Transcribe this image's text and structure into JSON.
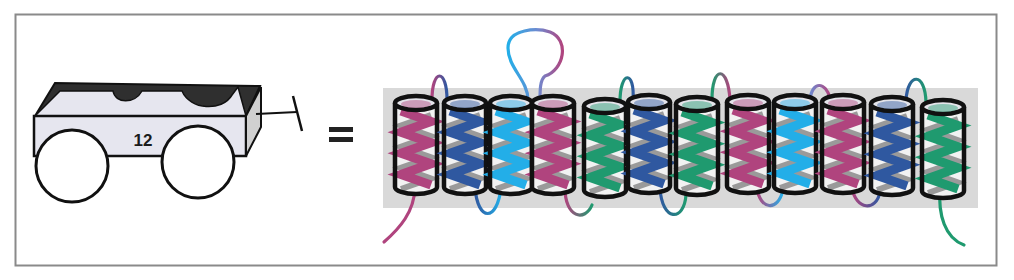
{
  "figure": {
    "cart": {
      "label": "12",
      "body_fill": "#e6e6ef",
      "top_fill": "#2f2f2f",
      "side_fill": "#d0d0d0"
    },
    "equals_sign": "=",
    "membrane": {
      "fill": "#d9d9d9",
      "x": 383,
      "y": 88,
      "width": 595,
      "height": 120
    },
    "colors": {
      "magenta": "#b0447e",
      "blue": "#2f58a0",
      "cyan": "#23aee8",
      "green": "#1f9a6f",
      "outline": "#111111",
      "frame": "#8a8a8a"
    },
    "helices": [
      {
        "index": 1,
        "cx": 416,
        "top": 103,
        "color": "magenta"
      },
      {
        "index": 2,
        "cx": 465,
        "top": 103,
        "color": "blue"
      },
      {
        "index": 3,
        "cx": 511,
        "top": 103,
        "color": "cyan"
      },
      {
        "index": 4,
        "cx": 553,
        "top": 103,
        "color": "magenta"
      },
      {
        "index": 5,
        "cx": 605,
        "top": 106,
        "color": "green"
      },
      {
        "index": 6,
        "cx": 649,
        "top": 102,
        "color": "blue"
      },
      {
        "index": 7,
        "cx": 697,
        "top": 104,
        "color": "green"
      },
      {
        "index": 8,
        "cx": 748,
        "top": 102,
        "color": "magenta"
      },
      {
        "index": 9,
        "cx": 795,
        "top": 102,
        "color": "cyan"
      },
      {
        "index": 10,
        "cx": 843,
        "top": 102,
        "color": "magenta"
      },
      {
        "index": 11,
        "cx": 892,
        "top": 104,
        "color": "blue"
      },
      {
        "index": 12,
        "cx": 943,
        "top": 107,
        "color": "green"
      }
    ]
  }
}
